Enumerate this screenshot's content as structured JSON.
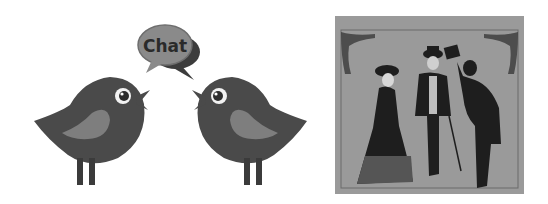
{
  "left_illustration": {
    "description": "two cartoon birds facing each other with a speech bubble",
    "speech_bubble": {
      "text": "Chat"
    },
    "colors": {
      "bird_body": "#4a4a4a",
      "bird_wing": "#7e7e7e",
      "bubble_front": "#8a8a8a",
      "bubble_back": "#3c3c3c",
      "text": "#2a2a2a"
    }
  },
  "right_illustration": {
    "description": "vintage engraving of a lady and two gentlemen, one tipping his hat",
    "colors": {
      "background": "#9a9a9a",
      "ink": "#1e1e1e"
    }
  }
}
